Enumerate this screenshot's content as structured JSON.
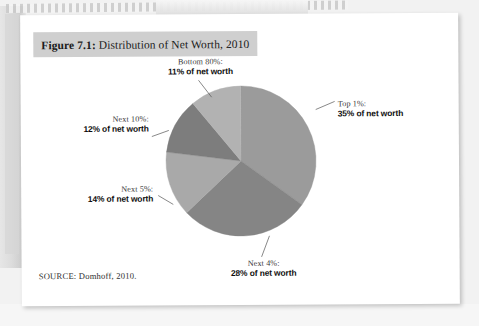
{
  "page": {
    "figure_number": "Figure 7.1",
    "title_prefix": "Figure 7.1:",
    "title_rest": " Distribution of Net Worth, 2010",
    "source": "SOURCE: Domhoff, 2010.",
    "title_highlight_color": "#cfcfcf",
    "page_background": "#ffffff"
  },
  "chart_data": {
    "type": "pie",
    "title": "Figure 7.1: Distribution of Net Worth, 2010",
    "subtitle": "",
    "xlabel": "",
    "ylabel": "",
    "legend_position": "callout-labels",
    "grid": false,
    "units": "percent of net worth",
    "categories": [
      "Top 1%",
      "Next 4%",
      "Next 5%",
      "Next 10%",
      "Bottom 80%"
    ],
    "values": [
      35,
      28,
      14,
      12,
      11
    ],
    "colors": [
      "#9b9b9b",
      "#858585",
      "#a9a9a9",
      "#7d7d7d",
      "#b2b2b2"
    ],
    "slices": [
      {
        "name": "Top 1%",
        "label_line1": "Top 1%:",
        "label_line2": "35% of net worth",
        "value": 35,
        "color": "#9b9b9b",
        "start_deg": 0,
        "end_deg": 126
      },
      {
        "name": "Next 4%",
        "label_line1": "Next 4%:",
        "label_line2": "28% of net worth",
        "value": 28,
        "color": "#858585",
        "start_deg": 126,
        "end_deg": 226.8
      },
      {
        "name": "Next 5%",
        "label_line1": "Next 5%:",
        "label_line2": "14% of net worth",
        "value": 14,
        "color": "#a9a9a9",
        "start_deg": 226.8,
        "end_deg": 277.2
      },
      {
        "name": "Next 10%",
        "label_line1": "Next 10%:",
        "label_line2": "12% of net worth",
        "value": 12,
        "color": "#7d7d7d",
        "start_deg": 277.2,
        "end_deg": 320.4
      },
      {
        "name": "Bottom 80%",
        "label_line1": "Bottom 80%:",
        "label_line2": "11% of net worth",
        "value": 11,
        "color": "#b2b2b2",
        "start_deg": 320.4,
        "end_deg": 360
      }
    ]
  }
}
